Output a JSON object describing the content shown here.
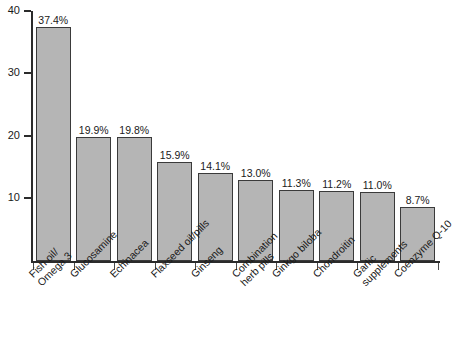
{
  "chart_data": {
    "type": "bar",
    "title": "",
    "subtitle": "",
    "xlabel": "",
    "ylabel": "",
    "ylim": [
      0,
      40
    ],
    "yticks": [
      10,
      20,
      30,
      40
    ],
    "ytick_labels": [
      "10",
      "20",
      "30",
      "40"
    ],
    "grid": false,
    "legend": false,
    "orientation": "vertical",
    "bar_fill_color": "#b5b5b5",
    "bar_edge_color": "#3a3a3a",
    "axis_color": "#2b2b2b",
    "categories": [
      "Fish oil/\nOmega 3",
      "Glucosamine",
      "Echinacea",
      "Flaxseed oil/pills",
      "Ginseng",
      "Combination\nherb pills",
      "Ginkgo biloba",
      "Chondroitin",
      "Garlic\nsupplements",
      "Coenzyme Q-10"
    ],
    "values": [
      37.4,
      19.9,
      19.8,
      15.9,
      14.1,
      13.0,
      11.3,
      11.2,
      11.0,
      8.7
    ],
    "value_labels": [
      "37.4%",
      "19.9%",
      "19.8%",
      "15.9%",
      "14.1%",
      "13.0%",
      "11.3%",
      "11.2%",
      "11.0%",
      "8.7%"
    ]
  }
}
